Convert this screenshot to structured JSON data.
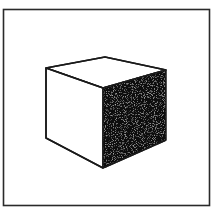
{
  "image": {
    "subject": "hand-drawn cube inside a square frame",
    "colors": {
      "background": "#ffffff",
      "stroke": "#1a1a1a",
      "shaded_face": "#0d0d0d",
      "light_faces": "#ffffff"
    },
    "frame": {
      "x": 3.5,
      "y": 9.5,
      "width": 206,
      "height": 196
    },
    "cube": {
      "vertices": {
        "top_back": [
          105,
          57
        ],
        "left_top": [
          46,
          68
        ],
        "right_top": [
          166,
          70
        ],
        "front_top": [
          103,
          88
        ],
        "left_bottom": [
          46,
          138
        ],
        "front_bottom": [
          103,
          168
        ],
        "right_bottom": [
          166,
          140
        ]
      }
    }
  }
}
